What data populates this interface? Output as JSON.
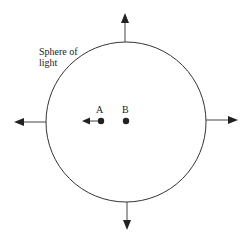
{
  "diagram": {
    "title_label": "Sphere of light",
    "label_line1": "Sphere of",
    "label_line2": "light",
    "sphere": {
      "cx": 126,
      "cy": 122,
      "r": 80,
      "stroke": "#333333"
    },
    "points": [
      {
        "name": "A",
        "x": 101,
        "y": 121
      },
      {
        "name": "B",
        "x": 126,
        "y": 121
      }
    ],
    "arrows": [
      {
        "direction": "up",
        "from": "sphere-top"
      },
      {
        "direction": "down",
        "from": "sphere-bottom"
      },
      {
        "direction": "left",
        "from": "sphere-left"
      },
      {
        "direction": "right",
        "from": "sphere-right"
      },
      {
        "direction": "left",
        "from": "point-A"
      }
    ]
  }
}
